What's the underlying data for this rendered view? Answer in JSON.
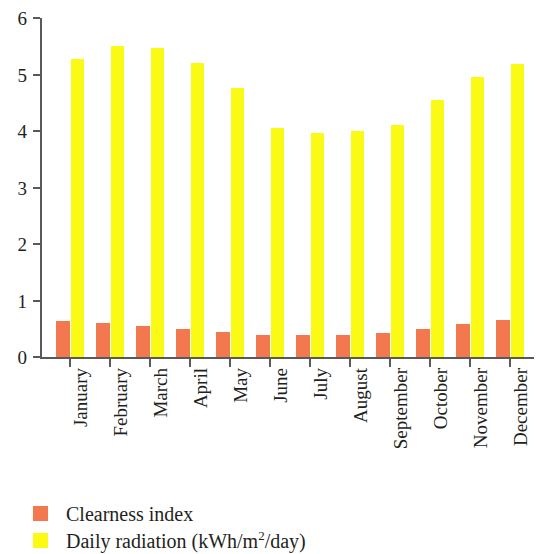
{
  "chart_data": {
    "type": "bar",
    "title": "",
    "subtitle": "",
    "xlabel": "",
    "ylabel": "",
    "ylim": [
      0,
      6
    ],
    "yticks": [
      0,
      1,
      2,
      3,
      4,
      5,
      6
    ],
    "ytick_labels": [
      "0",
      "1",
      "2",
      "3",
      "4",
      "5",
      "6"
    ],
    "grid": false,
    "legend_position": "bottom-left",
    "categories": [
      "January",
      "February",
      "March",
      "April",
      "May",
      "June",
      "July",
      "August",
      "September",
      "October",
      "November",
      "December"
    ],
    "series": [
      {
        "name": "Clearness index",
        "color": "#F4784F",
        "values": [
          0.63,
          0.6,
          0.55,
          0.5,
          0.45,
          0.39,
          0.39,
          0.39,
          0.42,
          0.49,
          0.58,
          0.65
        ]
      },
      {
        "name": "Daily radiation (kWh/m2/day)",
        "color": "#FAFA14",
        "values": [
          5.28,
          5.51,
          5.47,
          5.21,
          4.77,
          4.05,
          3.96,
          4.0,
          4.1,
          4.55,
          4.95,
          5.19
        ]
      }
    ]
  },
  "legend": {
    "items": [
      {
        "label": "Clearness index",
        "label_prefix": "Clearness index",
        "superscript": "",
        "label_suffix": "",
        "color": "#F4784F",
        "swatch_name": "legend-swatch-clearness-index"
      },
      {
        "label": "Daily radiation (kWh/m2/day)",
        "label_prefix": "Daily radiation (kWh/m",
        "superscript": "2",
        "label_suffix": "/day)",
        "color": "#FAFA14",
        "swatch_name": "legend-swatch-daily-radiation"
      }
    ]
  },
  "axes": {
    "y_axis_color": "#58595b",
    "x_axis_color": "#58595b",
    "y_min_label": "0",
    "y_max_label": "6"
  }
}
